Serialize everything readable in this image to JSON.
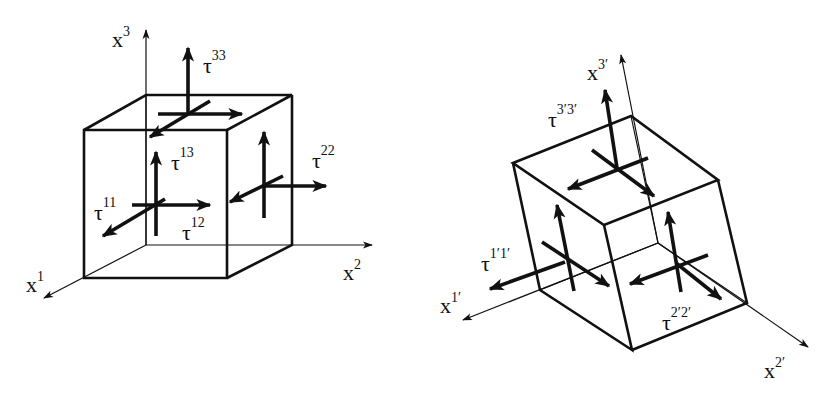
{
  "figure": {
    "left_panel": {
      "name": "original coordinates",
      "axes": [
        {
          "id": "x1",
          "base": "x",
          "sup": "1"
        },
        {
          "id": "x2",
          "base": "x",
          "sup": "2"
        },
        {
          "id": "x3",
          "base": "x",
          "sup": "3"
        }
      ],
      "stress_labels": [
        {
          "id": "tau11",
          "base": "τ",
          "sup": "11"
        },
        {
          "id": "tau12",
          "base": "τ",
          "sup": "12"
        },
        {
          "id": "tau13",
          "base": "τ",
          "sup": "13"
        },
        {
          "id": "tau22",
          "base": "τ",
          "sup": "22"
        },
        {
          "id": "tau33",
          "base": "τ",
          "sup": "33"
        }
      ]
    },
    "right_panel": {
      "name": "rotated coordinates",
      "axes": [
        {
          "id": "x1p",
          "base": "x",
          "sup": "1′"
        },
        {
          "id": "x2p",
          "base": "x",
          "sup": "2′"
        },
        {
          "id": "x3p",
          "base": "x",
          "sup": "3′"
        }
      ],
      "stress_labels": [
        {
          "id": "tau1p1p",
          "base": "τ",
          "sup": "1′1′"
        },
        {
          "id": "tau2p2p",
          "base": "τ",
          "sup": "2′2′"
        },
        {
          "id": "tau3p3p",
          "base": "τ",
          "sup": "3′3′"
        }
      ]
    },
    "caption": "",
    "colors": {
      "ink": "#111111",
      "background": "#ffffff"
    }
  }
}
